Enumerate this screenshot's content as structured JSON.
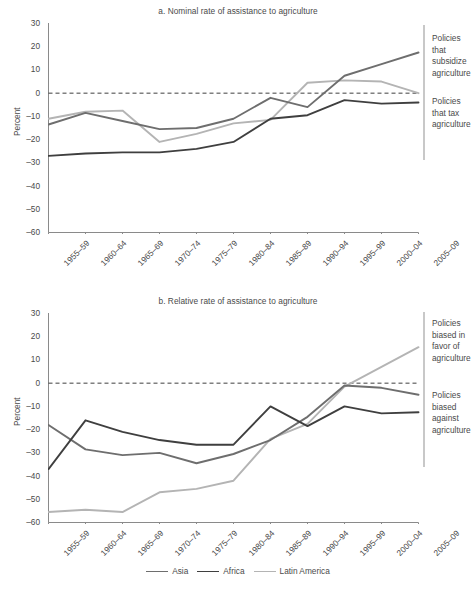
{
  "figure": {
    "ylabel": "Percent",
    "legend": {
      "position": "bottom-center",
      "items": [
        {
          "name": "Asia",
          "color": "#6e6e6e"
        },
        {
          "name": "Africa",
          "color": "#3f3f3f"
        },
        {
          "name": "Latin America",
          "color": "#b4b4b4"
        }
      ]
    }
  },
  "chart_data": [
    {
      "type": "line",
      "id": "panel-a",
      "title": "a. Nominal rate of assistance to agriculture",
      "xlabel": "",
      "ylabel": "Percent",
      "ylim": [
        -60,
        30
      ],
      "yticks": [
        30,
        20,
        10,
        0,
        -10,
        -20,
        -30,
        -40,
        -50,
        -60
      ],
      "ytick_labels": [
        "30",
        "20",
        "10",
        "0",
        "–10",
        "–20",
        "–30",
        "–40",
        "–50",
        "–60"
      ],
      "grid": false,
      "zero_line": true,
      "categories": [
        "1955–59",
        "1960–64",
        "1965–69",
        "1970–74",
        "1975–79",
        "1980–84",
        "1985–89",
        "1990–94",
        "1995–99",
        "2000–04",
        "2005–09"
      ],
      "series": [
        {
          "name": "Asia",
          "color": "#6e6e6e",
          "values": [
            -13.5,
            -8.5,
            -12.0,
            -15.5,
            -15.0,
            -11.0,
            -2.0,
            -6.0,
            7.5,
            12.5,
            17.5
          ]
        },
        {
          "name": "Africa",
          "color": "#3f3f3f",
          "values": [
            -27.0,
            -26.0,
            -25.5,
            -25.5,
            -24.0,
            -21.0,
            -11.0,
            -9.5,
            -3.0,
            -4.5,
            -4.0
          ]
        },
        {
          "name": "Latin America",
          "color": "#b4b4b4",
          "values": [
            -11.0,
            -8.0,
            -7.5,
            -21.0,
            -17.5,
            -13.0,
            -11.5,
            4.5,
            5.5,
            5.0,
            0.0
          ]
        }
      ],
      "annotations": [
        {
          "id": "subsidize",
          "text": "Policies that subsidize agriculture",
          "lines": [
            "Policies",
            "that",
            "subsidize",
            "agriculture"
          ],
          "region": "above-zero"
        },
        {
          "id": "tax",
          "text": "Policies that tax agriculture",
          "lines": [
            "Policies",
            "that tax",
            "agriculture"
          ],
          "region": "below-zero"
        }
      ]
    },
    {
      "type": "line",
      "id": "panel-b",
      "title": "b. Relative rate of assistance to agriculture",
      "xlabel": "",
      "ylabel": "Percent",
      "ylim": [
        -60,
        30
      ],
      "yticks": [
        30,
        20,
        10,
        0,
        -10,
        -20,
        -30,
        -40,
        -50,
        -60
      ],
      "ytick_labels": [
        "30",
        "20",
        "10",
        "0",
        "–10",
        "–20",
        "–30",
        "–40",
        "–50",
        "–60"
      ],
      "grid": false,
      "zero_line": true,
      "categories": [
        "1955–59",
        "1960–64",
        "1965–69",
        "1970–74",
        "1975–79",
        "1980–84",
        "1985–89",
        "1990–94",
        "1995–99",
        "2000–04",
        "2005–09"
      ],
      "series": [
        {
          "name": "Asia",
          "color": "#6e6e6e",
          "values": [
            -18.0,
            -28.5,
            -31.0,
            -30.0,
            -34.5,
            -30.5,
            -24.5,
            -14.5,
            -1.0,
            -2.0,
            -5.0
          ]
        },
        {
          "name": "Africa",
          "color": "#3f3f3f",
          "values": [
            -37.0,
            -16.0,
            -21.0,
            -24.5,
            -26.5,
            -26.5,
            -10.0,
            -18.5,
            -10.0,
            -13.0,
            -12.5
          ]
        },
        {
          "name": "Latin America",
          "color": "#b4b4b4",
          "values": [
            -55.5,
            -54.5,
            -55.5,
            -47.0,
            -45.5,
            -42.0,
            -24.0,
            -17.5,
            -1.5,
            7.0,
            15.5
          ]
        }
      ],
      "annotations": [
        {
          "id": "favor",
          "text": "Policies biased in favor of agriculture",
          "lines": [
            "Policies",
            "biased in",
            "favor of",
            "agriculture"
          ],
          "region": "above-zero"
        },
        {
          "id": "against",
          "text": "Policies biased against agriculture",
          "lines": [
            "Policies",
            "biased",
            "against",
            "agriculture"
          ],
          "region": "below-zero"
        }
      ]
    }
  ]
}
